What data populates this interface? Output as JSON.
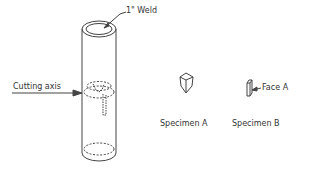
{
  "labels": {
    "weld": "1\" Weld",
    "cutting_axis": "Cutting axis",
    "specimen_a": "Specimen A",
    "specimen_b": "Specimen B",
    "face_a": "Face A"
  },
  "colors": {
    "line": "#444444",
    "text": "#333333",
    "background": "#ffffff"
  }
}
